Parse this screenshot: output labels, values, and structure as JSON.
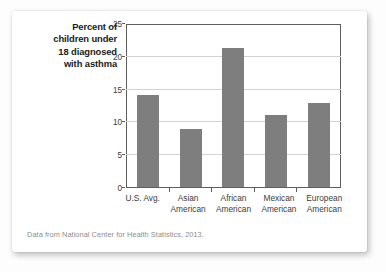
{
  "card": {
    "source_note": "Data from National Center for Health Statistics, 2013."
  },
  "chart_data": {
    "type": "bar",
    "title": "",
    "axis_title": "Percent of children under 18 diagnosed with asthma",
    "axis_title_lines": [
      "Percent of",
      "children under",
      "18 diagnosed",
      "with asthma"
    ],
    "categories": [
      "U.S. Avg.",
      "Asian American",
      "African American",
      "Mexican American",
      "European American"
    ],
    "category_label_lines": [
      [
        "U.S. Avg.",
        ""
      ],
      [
        "Asian",
        "American"
      ],
      [
        "African",
        "American"
      ],
      [
        "Mexican",
        "American"
      ],
      [
        "European",
        "American"
      ]
    ],
    "values": [
      14.2,
      9.0,
      21.4,
      11.1,
      13.0
    ],
    "xlabel": "",
    "ylabel": "Percent of children under 18 diagnosed with asthma",
    "ylim": [
      0,
      25
    ],
    "yticks": [
      0,
      5,
      10,
      15,
      20,
      25
    ],
    "ytick_labels": [
      "0",
      "5",
      "10",
      "15",
      "20",
      "25"
    ],
    "grid": "horizontal",
    "legend": "none",
    "bar_color": "#7e7e7e",
    "grid_color": "#d2d2d2",
    "axis_color": "#5e5e5e"
  }
}
